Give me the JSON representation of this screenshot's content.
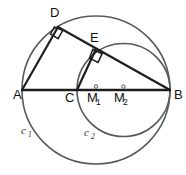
{
  "figure": {
    "background_color": "#ffffff",
    "width": 186,
    "height": 175
  },
  "colors": {
    "circle_stroke": "#555a5c",
    "chord_stroke": "#1d1d1d",
    "label_text": "#101010",
    "circle_label_text": "#2b2b2b"
  },
  "points": [
    {
      "id": "A",
      "label": "A",
      "x": 22,
      "y": 90,
      "label_x": 13,
      "label_y": 99
    },
    {
      "id": "B",
      "label": "B",
      "x": 170,
      "y": 90,
      "label_x": 174,
      "label_y": 99
    },
    {
      "id": "C",
      "label": "C",
      "x": 77,
      "y": 90,
      "label_x": 65,
      "label_y": 102
    },
    {
      "id": "D",
      "label": "D",
      "x": 58,
      "y": 27,
      "label_x": 50,
      "label_y": 17
    },
    {
      "id": "E",
      "label": "E",
      "x": 95.5,
      "y": 50,
      "label_x": 90,
      "label_y": 42
    },
    {
      "id": "M1",
      "label": "M",
      "sub": "1",
      "x": 96,
      "y": 90,
      "label_x": 87,
      "label_y": 102,
      "sub_x": 96,
      "sub_y": 105
    },
    {
      "id": "M2",
      "label": "M",
      "sub": "2",
      "x": 123.5,
      "y": 90,
      "label_x": 114,
      "label_y": 102,
      "sub_x": 123,
      "sub_y": 105
    }
  ],
  "circles": [
    {
      "id": "c1",
      "label": "c",
      "sub": "1",
      "center_x": 96,
      "center_y": 90,
      "radius": 74,
      "diameter_endpoints": [
        "A",
        "B"
      ],
      "label_x": 21,
      "label_y": 134,
      "sub_x": 28,
      "sub_y": 137
    },
    {
      "id": "c2",
      "label": "c",
      "sub": "2",
      "center_x": 123.5,
      "center_y": 90,
      "radius": 46.5,
      "diameter_endpoints": [
        "C",
        "B"
      ],
      "label_x": 84,
      "label_y": 136,
      "sub_x": 91,
      "sub_y": 139
    }
  ],
  "segments": [
    {
      "id": "AB",
      "from": "A",
      "to": "B",
      "kind": "baseline",
      "x1": 22,
      "y1": 90,
      "x2": 170,
      "y2": 90
    },
    {
      "id": "AD",
      "from": "A",
      "to": "D",
      "kind": "chord",
      "x1": 22,
      "y1": 90,
      "x2": 58,
      "y2": 27
    },
    {
      "id": "DB",
      "from": "D",
      "to": "B",
      "kind": "chord",
      "x1": 58,
      "y1": 27,
      "x2": 170,
      "y2": 90
    },
    {
      "id": "CE",
      "from": "C",
      "to": "E",
      "kind": "chord",
      "x1": 77,
      "y1": 90,
      "x2": 95.5,
      "y2": 50
    }
  ],
  "right_angles": [
    {
      "id": "angle-ADB",
      "vertex": "D",
      "marker_points": "62.7,30.6 58.1,38.7 50.5,33.9 54.4,26.9"
    },
    {
      "id": "angle-CEB",
      "vertex": "E",
      "marker_points": "102.2,53.7 98.0,62.4 89.5,58.2 92.8,49.3"
    }
  ],
  "center_dots": [
    {
      "id": "dot-M1",
      "x": 96,
      "y": 86.5,
      "r": 1.7
    },
    {
      "id": "dot-M2",
      "x": 123.5,
      "y": 86.5,
      "r": 1.7
    }
  ]
}
